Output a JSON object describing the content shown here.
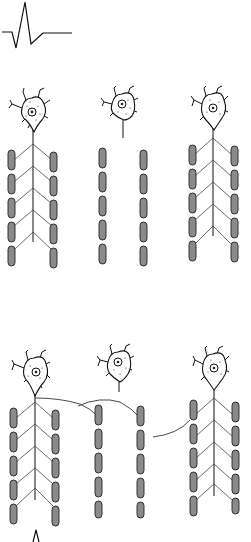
{
  "figure": {
    "background": "#ffffff",
    "fiber_color": "#8a8a8a",
    "line_color": "#111111",
    "top_waveform": {
      "icon": "action-potential-waveform-icon",
      "x": 2,
      "y": 32
    },
    "bottom_waveform": {
      "icon": "small-waveform-icon",
      "x": 30,
      "y": 532
    },
    "panels": [
      {
        "name": "before-reinnervation",
        "neurons": [
          {
            "cx": 33,
            "cy": 112,
            "innervated": true,
            "fiber_cols": [
              12,
              54
            ],
            "fiber_top": 152
          },
          {
            "cx": 123,
            "cy": 112,
            "innervated": false,
            "fiber_cols": [
              102,
              143
            ],
            "fiber_top": 150
          },
          {
            "cx": 213,
            "cy": 112,
            "innervated": true,
            "fiber_cols": [
              192,
              234
            ],
            "fiber_top": 146
          }
        ]
      },
      {
        "name": "after-reinnervation",
        "neurons": [
          {
            "cx": 35,
            "cy": 372,
            "innervated": true,
            "fiber_cols": [
              13,
              55
            ],
            "fiber_top": 408
          },
          {
            "cx": 120,
            "cy": 370,
            "innervated": false,
            "fiber_cols": [
              98,
              140
            ],
            "fiber_top": 406
          },
          {
            "cx": 214,
            "cy": 372,
            "innervated": true,
            "fiber_cols": [
              193,
              235
            ],
            "fiber_top": 400
          }
        ]
      }
    ]
  }
}
